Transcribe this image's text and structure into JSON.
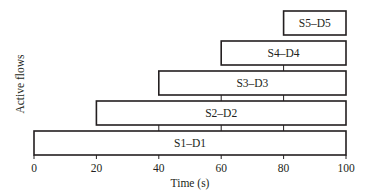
{
  "chart_data": {
    "type": "bar",
    "orientation": "horizontal-gantt",
    "title": "",
    "xlabel": "Time (s)",
    "ylabel": "Active flows",
    "xlim": [
      0,
      100
    ],
    "xticks": [
      0,
      20,
      40,
      60,
      80,
      100
    ],
    "grid": false,
    "legend": null,
    "series": [
      {
        "name": "S1–D1",
        "start": 0,
        "end": 100
      },
      {
        "name": "S2–D2",
        "start": 20,
        "end": 100
      },
      {
        "name": "S3–D3",
        "start": 40,
        "end": 100
      },
      {
        "name": "S4–D4",
        "start": 60,
        "end": 100
      },
      {
        "name": "S5–D5",
        "start": 80,
        "end": 100
      }
    ]
  },
  "colors": {
    "stroke": "#231f20",
    "fill": "#ffffff"
  }
}
